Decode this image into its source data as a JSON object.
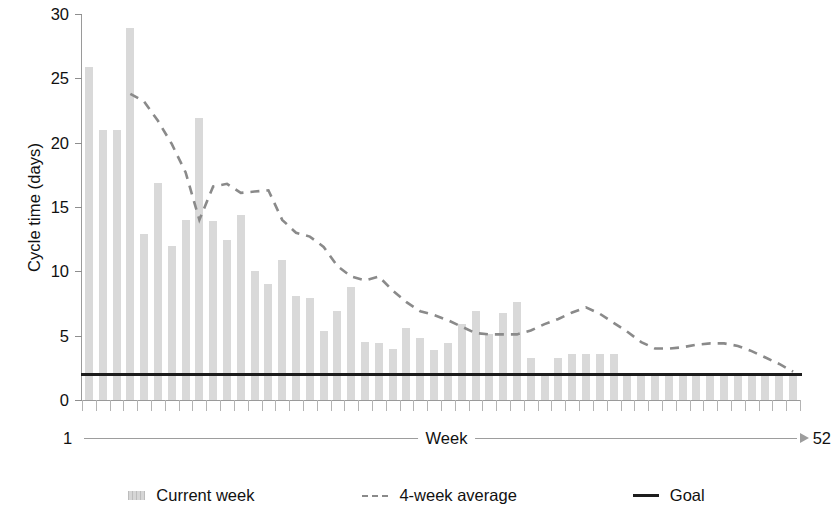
{
  "chart_data": {
    "type": "bar",
    "title": "",
    "xlabel": "Week",
    "ylabel": "Cycle time (days)",
    "ylim": [
      0,
      30
    ],
    "yticks": [
      0,
      5,
      10,
      15,
      20,
      25,
      30
    ],
    "ytick_labels": [
      "0",
      "5",
      "10",
      "15",
      "20",
      "25",
      "30"
    ],
    "xlim": [
      1,
      52
    ],
    "x_axis_start_label": "1",
    "x_axis_end_label": "52",
    "x_axis_mid_label": "Week",
    "grid": false,
    "legend_position": "bottom",
    "categories": [
      1,
      2,
      3,
      4,
      5,
      6,
      7,
      8,
      9,
      10,
      11,
      12,
      13,
      14,
      15,
      16,
      17,
      18,
      19,
      20,
      21,
      22,
      23,
      24,
      25,
      26,
      27,
      28,
      29,
      30,
      31,
      32,
      33,
      34,
      35,
      36,
      37,
      38,
      39,
      40,
      41,
      42,
      43,
      44,
      45,
      46,
      47,
      48,
      49,
      50,
      51,
      52
    ],
    "series": [
      {
        "name": "Current week",
        "type": "bar",
        "color": "#d9d9d9",
        "values": [
          25.9,
          21.0,
          21.0,
          28.9,
          12.9,
          16.9,
          12.0,
          14.0,
          21.9,
          13.9,
          12.4,
          14.4,
          10.0,
          9.0,
          10.9,
          8.1,
          7.9,
          5.4,
          6.9,
          8.8,
          4.5,
          4.4,
          4.0,
          5.6,
          4.8,
          3.9,
          4.4,
          5.9,
          6.9,
          5.1,
          6.8,
          7.6,
          3.3,
          2.0,
          3.3,
          3.6,
          3.6,
          3.6,
          3.6,
          2.0,
          2.0,
          2.0,
          2.0,
          2.0,
          2.0,
          2.0,
          2.0,
          2.0,
          2.0,
          2.0,
          2.0,
          1.9
        ]
      },
      {
        "name": "4-week average",
        "type": "line",
        "style": "dashed",
        "color": "#8a8a8a",
        "x": [
          4,
          5,
          6,
          7,
          8,
          9,
          10,
          11,
          12,
          13,
          14,
          15,
          16,
          17,
          18,
          19,
          20,
          21,
          22,
          23,
          24,
          25,
          26,
          27,
          28,
          29,
          30,
          31,
          32,
          33,
          34,
          35,
          36,
          37,
          38,
          39,
          40,
          41,
          42,
          43,
          44,
          45,
          46,
          47,
          48,
          49,
          50,
          51,
          52
        ],
        "values": [
          23.8,
          23.2,
          21.7,
          19.9,
          17.7,
          14.0,
          16.6,
          16.8,
          16.1,
          16.2,
          16.3,
          14.0,
          13.0,
          12.7,
          11.9,
          10.4,
          9.6,
          9.3,
          9.6,
          8.5,
          7.6,
          6.9,
          6.6,
          6.2,
          5.7,
          5.2,
          5.1,
          5.1,
          5.1,
          5.4,
          5.9,
          6.3,
          6.8,
          7.2,
          6.7,
          6.0,
          5.3,
          4.5,
          4.0,
          4.0,
          4.1,
          4.3,
          4.4,
          4.4,
          4.2,
          3.8,
          3.3,
          2.8,
          2.2
        ]
      },
      {
        "name": "Goal",
        "type": "hline",
        "style": "solid",
        "color": "#1d1d1d",
        "value": 2.0
      }
    ],
    "legend": [
      {
        "label": "Current week",
        "swatch": "bar-swatch",
        "color": "#d9d9d9"
      },
      {
        "label": "4-week average",
        "swatch": "dashed-line-swatch",
        "color": "#8a8a8a"
      },
      {
        "label": "Goal",
        "swatch": "solid-line-swatch",
        "color": "#1d1d1d"
      }
    ]
  }
}
